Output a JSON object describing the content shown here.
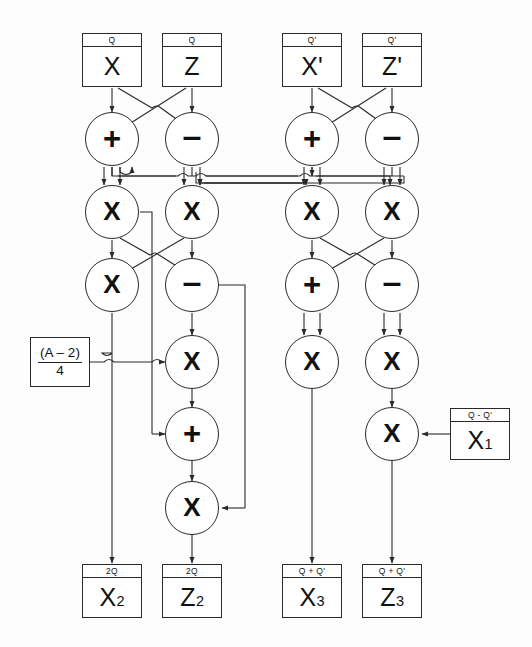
{
  "diagram": {
    "stroke_color": "#2a2a2a",
    "background_color": "#fdfdfd",
    "inputs": [
      {
        "id": "in-x",
        "header": "Q",
        "value": "X",
        "x": 112,
        "y": 60
      },
      {
        "id": "in-z",
        "header": "Q",
        "value": "Z",
        "x": 192,
        "y": 60
      },
      {
        "id": "in-xp",
        "header": "Q'",
        "value": "X'",
        "x": 312,
        "y": 60
      },
      {
        "id": "in-zp",
        "header": "Q'",
        "value": "Z'",
        "x": 392,
        "y": 60
      }
    ],
    "constant_box": {
      "id": "const-a",
      "numerator": "(A – 2)",
      "denominator": "4",
      "x": 60,
      "y": 354
    },
    "side_input": {
      "id": "in-x1",
      "header": "Q - Q'",
      "value": "X",
      "subscript": "1",
      "x": 480,
      "y": 434
    },
    "outputs": [
      {
        "id": "out-x2",
        "header": "2Q",
        "value": "X",
        "subscript": "2",
        "x": 112,
        "y": 591
      },
      {
        "id": "out-z2",
        "header": "2Q",
        "value": "Z",
        "subscript": "2",
        "x": 192,
        "y": 591
      },
      {
        "id": "out-x3",
        "header": "Q + Q'",
        "value": "X",
        "subscript": "3",
        "x": 312,
        "y": 591
      },
      {
        "id": "out-z3",
        "header": "Q + Q'",
        "value": "Z",
        "subscript": "3",
        "x": 392,
        "y": 591
      }
    ],
    "operators": [
      {
        "id": "op-l1-plus",
        "symbol": "+",
        "kind": "plus",
        "x": 112,
        "y": 139
      },
      {
        "id": "op-l1-minus",
        "symbol": "–",
        "kind": "minus",
        "x": 192,
        "y": 139
      },
      {
        "id": "op-r1-plus",
        "symbol": "+",
        "kind": "plus",
        "x": 312,
        "y": 139
      },
      {
        "id": "op-r1-minus",
        "symbol": "–",
        "kind": "minus",
        "x": 392,
        "y": 139
      },
      {
        "id": "op-l2-sq1",
        "symbol": "X",
        "kind": "mul",
        "x": 112,
        "y": 212
      },
      {
        "id": "op-l2-sq2",
        "symbol": "X",
        "kind": "mul",
        "x": 192,
        "y": 212
      },
      {
        "id": "op-r2-mul1",
        "symbol": "X",
        "kind": "mul",
        "x": 312,
        "y": 212
      },
      {
        "id": "op-r2-mul2",
        "symbol": "X",
        "kind": "mul",
        "x": 392,
        "y": 212
      },
      {
        "id": "op-l3-mul",
        "symbol": "X",
        "kind": "mul",
        "x": 112,
        "y": 285
      },
      {
        "id": "op-l3-minus",
        "symbol": "–",
        "kind": "minus",
        "x": 192,
        "y": 285
      },
      {
        "id": "op-r3-plus",
        "symbol": "+",
        "kind": "plus",
        "x": 312,
        "y": 285
      },
      {
        "id": "op-r3-minus",
        "symbol": "–",
        "kind": "minus",
        "x": 392,
        "y": 285
      },
      {
        "id": "op-l4-mul",
        "symbol": "X",
        "kind": "mul",
        "x": 192,
        "y": 362
      },
      {
        "id": "op-r4-sq1",
        "symbol": "X",
        "kind": "mul",
        "x": 312,
        "y": 362
      },
      {
        "id": "op-r4-sq2",
        "symbol": "X",
        "kind": "mul",
        "x": 392,
        "y": 362
      },
      {
        "id": "op-l5-plus",
        "symbol": "+",
        "kind": "plus",
        "x": 192,
        "y": 434
      },
      {
        "id": "op-r5-mul",
        "symbol": "X",
        "kind": "mul",
        "x": 392,
        "y": 434
      },
      {
        "id": "op-l6-mul",
        "symbol": "X",
        "kind": "mul",
        "x": 192,
        "y": 508
      }
    ]
  }
}
